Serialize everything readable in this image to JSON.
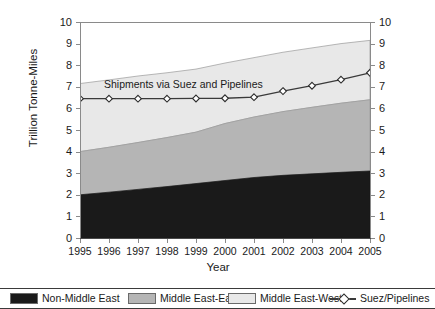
{
  "chart_data": {
    "type": "area",
    "title": "",
    "xlabel": "Year",
    "ylabel": "Trillion Tonne-Miles",
    "ylim": [
      0,
      10
    ],
    "ytick_labels": [
      "10",
      "9",
      "8",
      "7",
      "6",
      "5",
      "4",
      "3",
      "2",
      "1",
      "0"
    ],
    "right_axis": true,
    "right_ytick_labels": [
      "10",
      "9",
      "8",
      "7",
      "6",
      "5",
      "4",
      "3",
      "2",
      "1",
      "0"
    ],
    "grid": false,
    "legend_position": "bottom",
    "stacked": true,
    "categories": [
      "1995",
      "1996",
      "1997",
      "1998",
      "1999",
      "2000",
      "2001",
      "2002",
      "2003",
      "2004",
      "2005"
    ],
    "annotations": [
      {
        "text": "Shipments via Suez and Pipelines",
        "x": "1996",
        "y": 7.0
      }
    ],
    "series": [
      {
        "name": "Non-Middle East",
        "kind": "area",
        "color": "#1a1a1a",
        "values": [
          2.0,
          2.12,
          2.25,
          2.38,
          2.52,
          2.66,
          2.8,
          2.9,
          2.97,
          3.04,
          3.1
        ]
      },
      {
        "name": "Middle East-East",
        "kind": "area",
        "color": "#b5b5b5",
        "values": [
          2.0,
          2.08,
          2.17,
          2.27,
          2.38,
          2.64,
          2.8,
          2.95,
          3.08,
          3.2,
          3.3
        ]
      },
      {
        "name": "Middle East-West",
        "kind": "area",
        "color": "#e8e8e8",
        "values": [
          3.15,
          3.12,
          3.08,
          3.0,
          2.92,
          2.8,
          2.75,
          2.75,
          2.75,
          2.76,
          2.75
        ]
      },
      {
        "name": "Suez/Pipelines",
        "kind": "line",
        "color": "#3a3a3a",
        "marker": "diamond",
        "values": [
          6.45,
          6.45,
          6.45,
          6.45,
          6.46,
          6.47,
          6.52,
          6.8,
          7.05,
          7.33,
          7.65
        ]
      }
    ],
    "cumulative_tops": {
      "Non-Middle East": [
        2.0,
        2.12,
        2.25,
        2.38,
        2.52,
        2.66,
        2.8,
        2.9,
        2.97,
        3.04,
        3.1
      ],
      "Middle East-East": [
        4.0,
        4.2,
        4.42,
        4.65,
        4.9,
        5.3,
        5.6,
        5.85,
        6.05,
        6.24,
        6.4
      ],
      "Middle East-West": [
        7.15,
        7.32,
        7.5,
        7.65,
        7.82,
        8.1,
        8.35,
        8.6,
        8.8,
        9.0,
        9.15
      ]
    }
  },
  "legend": {
    "items": [
      {
        "label": "Non-Middle East",
        "type": "swatch",
        "color": "#1a1a1a"
      },
      {
        "label": "Middle East-East",
        "type": "swatch",
        "color": "#b5b5b5"
      },
      {
        "label": "Middle East-West",
        "type": "swatch",
        "color": "#e8e8e8"
      },
      {
        "label": "Suez/Pipelines",
        "type": "line",
        "color": "#3a3a3a"
      }
    ]
  }
}
